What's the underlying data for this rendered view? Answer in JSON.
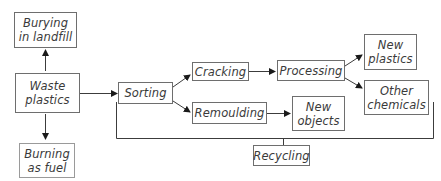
{
  "diagram": {
    "nodes": {
      "burying": "Burying\nin landfill",
      "waste": "Waste\nplastics",
      "burning": "Burning\nas fuel",
      "sorting": "Sorting",
      "cracking": "Cracking",
      "remoulding": "Remoulding",
      "processing": "Processing",
      "new_objects": "New\nobjects",
      "new_plastics": "New\nplastics",
      "other_chemicals": "Other\nchemicals",
      "recycling": "Recycling"
    },
    "edges": [
      {
        "from": "waste",
        "to": "burying"
      },
      {
        "from": "waste",
        "to": "burning"
      },
      {
        "from": "waste",
        "to": "sorting"
      },
      {
        "from": "sorting",
        "to": "cracking"
      },
      {
        "from": "sorting",
        "to": "remoulding"
      },
      {
        "from": "cracking",
        "to": "processing"
      },
      {
        "from": "remoulding",
        "to": "new_objects"
      },
      {
        "from": "processing",
        "to": "new_plastics"
      },
      {
        "from": "processing",
        "to": "other_chemicals"
      }
    ],
    "bracket_label": "recycling"
  }
}
